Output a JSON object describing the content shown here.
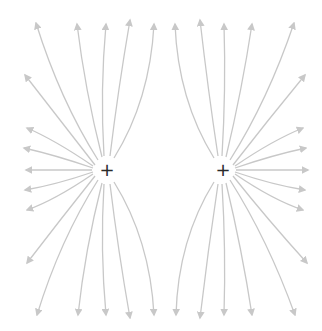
{
  "diagram": {
    "title": "",
    "type": "electric field lines of two like (positive) charges",
    "colors": {
      "background": "#ffffff",
      "field_line": "#c8c8c8",
      "charge_symbol": "#2a2a2a"
    },
    "charges": [
      {
        "id": "left",
        "symbol": "+",
        "x": 107,
        "y": 170
      },
      {
        "id": "right",
        "symbol": "+",
        "x": 223,
        "y": 170
      }
    ],
    "field_lines": {
      "left": [
        {
          "start": [
            98,
            160
          ],
          "ctrl": [
            60,
            100
          ],
          "end": [
            36,
            23
          ]
        },
        {
          "start": [
            102,
            157
          ],
          "ctrl": [
            85,
            90
          ],
          "end": [
            77,
            24
          ]
        },
        {
          "start": [
            104,
            156
          ],
          "ctrl": [
            100,
            90
          ],
          "end": [
            106,
            24
          ]
        },
        {
          "start": [
            110,
            156
          ],
          "ctrl": [
            118,
            90
          ],
          "end": [
            130,
            20
          ]
        },
        {
          "start": [
            114,
            158
          ],
          "ctrl": [
            150,
            100
          ],
          "end": [
            154,
            24
          ]
        },
        {
          "start": [
            95,
            165
          ],
          "ctrl": [
            60,
            120
          ],
          "end": [
            25,
            75
          ]
        },
        {
          "start": [
            93,
            166
          ],
          "ctrl": [
            55,
            140
          ],
          "end": [
            27,
            128
          ]
        },
        {
          "start": [
            93,
            168
          ],
          "ctrl": [
            55,
            155
          ],
          "end": [
            24,
            148
          ]
        },
        {
          "start": [
            92,
            170
          ],
          "ctrl": [
            60,
            170
          ],
          "end": [
            26,
            170
          ]
        },
        {
          "start": [
            93,
            172
          ],
          "ctrl": [
            55,
            185
          ],
          "end": [
            25,
            190
          ]
        },
        {
          "start": [
            93,
            174
          ],
          "ctrl": [
            55,
            200
          ],
          "end": [
            27,
            210
          ]
        },
        {
          "start": [
            95,
            176
          ],
          "ctrl": [
            60,
            220
          ],
          "end": [
            27,
            263
          ]
        },
        {
          "start": [
            98,
            180
          ],
          "ctrl": [
            60,
            240
          ],
          "end": [
            37,
            315
          ]
        },
        {
          "start": [
            102,
            183
          ],
          "ctrl": [
            85,
            250
          ],
          "end": [
            78,
            315
          ]
        },
        {
          "start": [
            104,
            184
          ],
          "ctrl": [
            100,
            250
          ],
          "end": [
            106,
            315
          ]
        },
        {
          "start": [
            110,
            184
          ],
          "ctrl": [
            118,
            250
          ],
          "end": [
            130,
            318
          ]
        },
        {
          "start": [
            114,
            182
          ],
          "ctrl": [
            150,
            240
          ],
          "end": [
            154,
            315
          ]
        }
      ],
      "right": [
        {
          "start": [
            214,
            158
          ],
          "ctrl": [
            178,
            100
          ],
          "end": [
            175,
            24
          ]
        },
        {
          "start": [
            218,
            156
          ],
          "ctrl": [
            208,
            90
          ],
          "end": [
            200,
            20
          ]
        },
        {
          "start": [
            222,
            156
          ],
          "ctrl": [
            226,
            90
          ],
          "end": [
            224,
            24
          ]
        },
        {
          "start": [
            226,
            157
          ],
          "ctrl": [
            242,
            90
          ],
          "end": [
            252,
            24
          ]
        },
        {
          "start": [
            230,
            160
          ],
          "ctrl": [
            268,
            100
          ],
          "end": [
            294,
            23
          ]
        },
        {
          "start": [
            233,
            165
          ],
          "ctrl": [
            268,
            120
          ],
          "end": [
            305,
            75
          ]
        },
        {
          "start": [
            235,
            166
          ],
          "ctrl": [
            273,
            140
          ],
          "end": [
            303,
            128
          ]
        },
        {
          "start": [
            235,
            168
          ],
          "ctrl": [
            273,
            155
          ],
          "end": [
            306,
            148
          ]
        },
        {
          "start": [
            236,
            170
          ],
          "ctrl": [
            268,
            170
          ],
          "end": [
            308,
            170
          ]
        },
        {
          "start": [
            235,
            172
          ],
          "ctrl": [
            273,
            185
          ],
          "end": [
            305,
            190
          ]
        },
        {
          "start": [
            235,
            174
          ],
          "ctrl": [
            273,
            200
          ],
          "end": [
            303,
            210
          ]
        },
        {
          "start": [
            233,
            176
          ],
          "ctrl": [
            268,
            220
          ],
          "end": [
            307,
            263
          ]
        },
        {
          "start": [
            230,
            180
          ],
          "ctrl": [
            268,
            240
          ],
          "end": [
            295,
            315
          ]
        },
        {
          "start": [
            226,
            183
          ],
          "ctrl": [
            242,
            250
          ],
          "end": [
            252,
            315
          ]
        },
        {
          "start": [
            222,
            184
          ],
          "ctrl": [
            226,
            250
          ],
          "end": [
            224,
            315
          ]
        },
        {
          "start": [
            218,
            184
          ],
          "ctrl": [
            208,
            250
          ],
          "end": [
            200,
            318
          ]
        },
        {
          "start": [
            214,
            182
          ],
          "ctrl": [
            178,
            240
          ],
          "end": [
            176,
            315
          ]
        }
      ]
    }
  }
}
